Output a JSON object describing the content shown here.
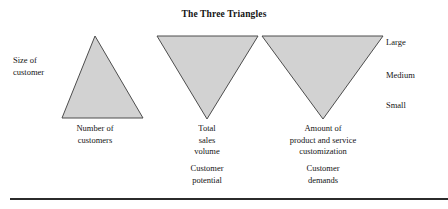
{
  "figure": {
    "title": "The Three Triangles",
    "axes": {
      "left_label_line1": "Size of",
      "left_label_line2": "customer",
      "scale_large": "Large",
      "scale_medium": "Medium",
      "scale_small": "Small"
    },
    "colors": {
      "triangle_fill": "#d2d2d2",
      "triangle_stroke": "#4d4d4d",
      "text": "#141414",
      "rule": "#2b2b2b",
      "background": "#ffffff"
    },
    "triangles": [
      {
        "name": "size-of-customer-triangle",
        "orientation": "up",
        "caption_line1": "Number of",
        "caption_line2": "customers",
        "subcaption": ""
      },
      {
        "name": "customer-potential-triangle",
        "orientation": "down",
        "caption_line1": "Total",
        "caption_line2": "sales",
        "caption_line3": "volume",
        "subcaption": "Customer potential",
        "subcaption_line1": "Customer",
        "subcaption_line2": "potential"
      },
      {
        "name": "customer-demands-triangle",
        "orientation": "down",
        "caption_line1": "Amount of",
        "caption_line2": "product and service",
        "caption_line3": "customization",
        "subcaption": "Customer demands",
        "subcaption_line1": "Customer",
        "subcaption_line2": "demands"
      }
    ]
  }
}
